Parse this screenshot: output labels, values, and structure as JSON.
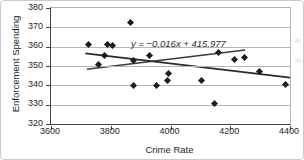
{
  "chart_data": {
    "type": "scatter",
    "title": "",
    "xlabel": "Crime Rate",
    "ylabel": "Enforcement Spending",
    "xlim": [
      3600,
      4400
    ],
    "ylim": [
      320,
      380
    ],
    "xticks": [
      3600,
      3800,
      4000,
      4200,
      4400
    ],
    "yticks": [
      320,
      330,
      340,
      350,
      360,
      370,
      380
    ],
    "grid": "horizontal",
    "legend": "none",
    "annotation": "y = −0.016x + 415.977",
    "points": [
      [
        3728,
        361
      ],
      [
        3790,
        361
      ],
      [
        3806,
        360.5
      ],
      [
        3781,
        355
      ],
      [
        3762,
        350.5
      ],
      [
        3868,
        372
      ],
      [
        3930,
        355
      ],
      [
        3877,
        352.5
      ],
      [
        3879,
        339.5
      ],
      [
        3956,
        339.5
      ],
      [
        3990,
        342
      ],
      [
        3995,
        346
      ],
      [
        4107,
        342.5
      ],
      [
        4150,
        330.5
      ],
      [
        4163,
        356.5
      ],
      [
        4216,
        353
      ],
      [
        4248,
        354
      ],
      [
        4300,
        347
      ],
      [
        4386,
        340
      ]
    ],
    "trendline": {
      "x1": 3715,
      "y1": 356.5,
      "x2": 4400,
      "y2": 344
    },
    "secondary_line": {
      "x1": 3720,
      "y1": 348.3,
      "x2": 4250,
      "y2": 358.3
    },
    "colors": {
      "marker": "#1c1c28",
      "trendline": "#2a2a2a",
      "secondary_line": "#3a3a3a",
      "gridline": "#b5b5b5",
      "axis": "#444444",
      "scan_artifact_green": "#9fd8a8",
      "scan_artifact_pink": "#e8b8c8"
    }
  }
}
